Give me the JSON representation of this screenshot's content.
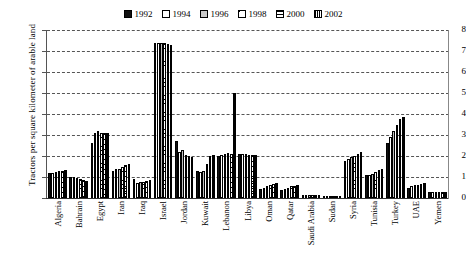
{
  "chart_data": {
    "type": "bar",
    "title": "",
    "xlabel": "",
    "ylabel": "Tractors per square kilometer of arable land",
    "ylim": [
      0,
      8
    ],
    "yticks": [
      0,
      1,
      2,
      3,
      4,
      5,
      6,
      7,
      8
    ],
    "grid": true,
    "legend_position": "top-center",
    "categories": [
      "Algeria",
      "Bahrain",
      "Egypt",
      "Iran",
      "Iraq",
      "Israel",
      "Jordan",
      "Kuwait",
      "Lebanon",
      "Libya",
      "Oman",
      "Qatar",
      "Saudi Arabia",
      "Sudan",
      "Syria",
      "Tunisia",
      "Turkey",
      "UAE",
      "Yemen"
    ],
    "series": [
      {
        "name": "1992",
        "color": "#111111",
        "pattern": "solid-black",
        "values": [
          1.2,
          1.0,
          2.6,
          1.3,
          0.9,
          7.4,
          2.7,
          1.3,
          2.0,
          2.1,
          0.45,
          0.4,
          0.12,
          0.08,
          1.75,
          1.1,
          2.6,
          0.5,
          0.3
        ]
      },
      {
        "name": "1994",
        "color": "#ffffff",
        "pattern": "white",
        "values": [
          1.2,
          1.0,
          3.1,
          1.4,
          0.7,
          7.4,
          2.2,
          1.25,
          2.05,
          2.1,
          0.5,
          0.45,
          0.12,
          0.09,
          1.85,
          1.1,
          2.9,
          0.55,
          0.3
        ]
      },
      {
        "name": "1996",
        "color": "#bfbfbf",
        "pattern": "light-gray",
        "values": [
          1.25,
          0.95,
          3.2,
          1.4,
          0.75,
          7.4,
          2.3,
          1.3,
          2.1,
          2.1,
          0.55,
          0.5,
          0.12,
          0.09,
          1.95,
          1.15,
          3.2,
          0.6,
          0.3
        ]
      },
      {
        "name": "1998",
        "color": "#ffffff",
        "pattern": "diagonal-hatch",
        "values": [
          1.3,
          0.9,
          3.1,
          1.5,
          0.75,
          7.4,
          2.05,
          1.6,
          2.15,
          2.05,
          0.6,
          0.55,
          0.13,
          0.1,
          2.0,
          1.25,
          3.5,
          0.6,
          0.3
        ]
      },
      {
        "name": "2000",
        "color": "#ffffff",
        "pattern": "horizontal-hatch",
        "values": [
          1.3,
          0.85,
          3.1,
          1.55,
          0.8,
          7.35,
          2.0,
          2.0,
          2.1,
          2.05,
          0.65,
          0.55,
          0.13,
          0.1,
          2.1,
          1.35,
          3.75,
          0.65,
          0.3
        ]
      },
      {
        "name": "2002",
        "color": "#777777",
        "pattern": "vertical-hatch",
        "values": [
          1.35,
          0.8,
          3.1,
          1.6,
          0.85,
          7.3,
          1.95,
          2.05,
          5.0,
          2.05,
          0.7,
          0.6,
          0.14,
          0.1,
          2.2,
          1.4,
          3.85,
          0.7,
          0.3
        ]
      }
    ]
  },
  "legend": {
    "items": [
      {
        "label": "1992",
        "swatch": "solid-black-swatch"
      },
      {
        "label": "1994",
        "swatch": "white-swatch"
      },
      {
        "label": "1996",
        "swatch": "gray-swatch"
      },
      {
        "label": "1998",
        "swatch": "diagonal-hatch-swatch"
      },
      {
        "label": "2000",
        "swatch": "horizontal-hatch-swatch"
      },
      {
        "label": "2002",
        "swatch": "vertical-hatch-swatch"
      }
    ]
  }
}
